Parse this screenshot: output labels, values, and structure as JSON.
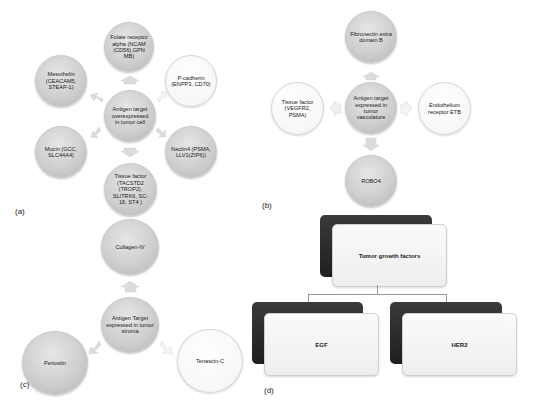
{
  "panels": {
    "a": {
      "label": "(a)",
      "center": "Antigen target overexpressed in tumor cell",
      "nodes": {
        "top": "Folate receptor alpha (NCAM (CD56),GPN MB)",
        "upper_left": "Mesothelin (CEACAM5, STEAP-1)",
        "upper_right": "P-cadherin (ENPP3, CD70)",
        "lower_left": "Mucin (GCC, SLC44A4)",
        "lower_right": "Nectin4 (PSMA, LLV1(ZIP6))",
        "bottom": "Tissue factor (TACSTD2 (TROP2), SLITRK6, SC-16, ST4 )"
      }
    },
    "b": {
      "label": "(b)",
      "center": "Antigen target expressed in tumor vasculature",
      "nodes": {
        "top": "Fibronectin extra domain B",
        "left": "Tissue factor (VEGFR2, PSMA)",
        "right": "Endothelium receptor ETB",
        "bottom": "ROBO4"
      }
    },
    "c": {
      "label": "(c)",
      "center": "Antigen Target expressed in tumor stroma",
      "nodes": {
        "top": "Collagen-IV",
        "left": "Periostin",
        "right": "Tenascin-C"
      }
    },
    "d": {
      "label": "(d)",
      "root": "Tumor growth factors",
      "children": [
        "EGF",
        "HER2"
      ]
    }
  },
  "colors": {
    "grey_node": "#cfcfcf",
    "white_node": "#f7f7f7",
    "dark_card": "#2a2a2a",
    "arrow": "#d9d9d9"
  }
}
